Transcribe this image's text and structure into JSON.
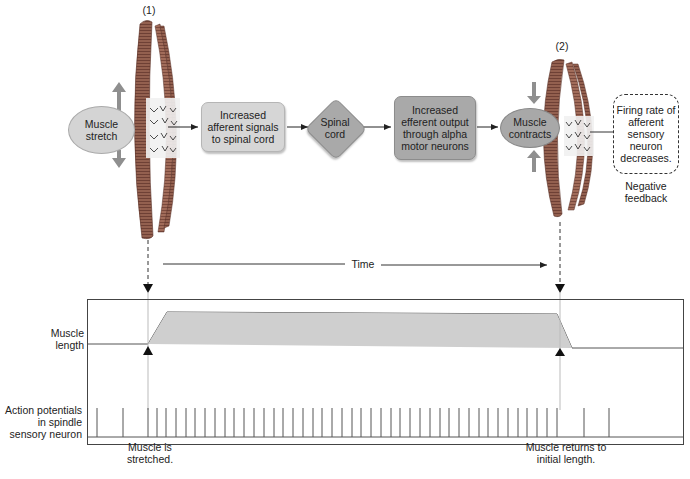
{
  "diagram": {
    "stage_labels": [
      "(1)",
      "(2)"
    ],
    "nodes": {
      "muscle_stretch": "Muscle stretch",
      "afferent_signals": "Increased afferent signals to spinal cord",
      "spinal_cord": "Spinal cord",
      "efferent_output": "Increased efferent output through alpha motor neurons",
      "muscle_contracts": "Muscle contracts",
      "firing_rate": "Firing rate of afferent sensory neuron decreases."
    },
    "feedback_label": "Negative feedback",
    "time_label": "Time",
    "colors": {
      "light_box": "#d6d6d6",
      "dark_box": "#a9a9a9",
      "muscle": "#8a5a4e",
      "arrow_gray": "#8f8f8f",
      "graph_fill": "#cfcfcf"
    }
  },
  "graph": {
    "row_labels": {
      "muscle_length": "Muscle length",
      "action_potentials": "Action potentials in spindle sensory neuron"
    },
    "annotations": {
      "stretched": "Muscle is stretched.",
      "returns": "Muscle returns to initial length."
    },
    "spike_x": [
      97,
      123,
      148,
      157,
      166,
      176,
      186,
      195,
      205,
      215,
      225,
      234,
      244,
      254,
      264,
      274,
      283,
      293,
      303,
      313,
      322,
      332,
      342,
      352,
      361,
      371,
      381,
      391,
      400,
      410,
      420,
      430,
      440,
      449,
      459,
      469,
      479,
      488,
      498,
      508,
      518,
      527,
      537,
      547,
      557,
      584,
      609
    ]
  }
}
